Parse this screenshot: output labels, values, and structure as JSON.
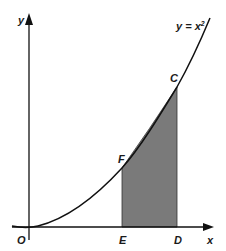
{
  "diagram": {
    "curve_label": "y = x",
    "curve_label_exponent": "2",
    "axis_labels": {
      "x": "x",
      "y": "y",
      "origin": "O"
    },
    "points": {
      "C": "C",
      "F": "F",
      "E": "E",
      "D": "D"
    },
    "colors": {
      "curve": "#111111",
      "axes": "#111111",
      "shaded_region": "#7a7a7a",
      "background": "#ffffff"
    }
  }
}
